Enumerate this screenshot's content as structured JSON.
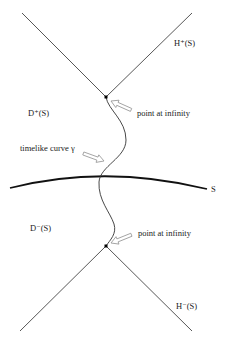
{
  "diagram": {
    "labels": {
      "h_plus": "H⁺(S)",
      "d_plus": "D⁺(S)",
      "point_top": "point at infinity",
      "timelike": "timelike curve γ",
      "s": "S",
      "d_minus": "D⁻(S)",
      "point_bottom": "point at infinity",
      "h_minus": "H⁻(S)"
    },
    "colors": {
      "line": "#444444",
      "surface": "#111111",
      "arrow_fill": "#ffffff",
      "arrow_stroke": "#999999"
    }
  }
}
